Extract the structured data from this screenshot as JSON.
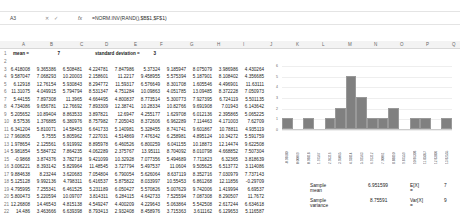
{
  "formula_bar": {
    "name_box": "A3",
    "icons": [
      "cancel-icon",
      "enter-icon"
    ],
    "fx_label": "fx",
    "formula": "=NORM.INV(RAND(),$B$1,$F$1)"
  },
  "columns": [
    "A",
    "B",
    "C",
    "D",
    "E",
    "F",
    "G",
    "H",
    "I",
    "J",
    "K",
    "L",
    "M",
    "N",
    "O",
    "P",
    "Q",
    "R"
  ],
  "header_row": {
    "row_num": "1",
    "mean_label": "mean =",
    "mean_value": "7",
    "sd_label": "standard deviation =",
    "sd_value": "3"
  },
  "rows": [
    {
      "n": "2",
      "cells": []
    },
    {
      "n": "3",
      "cells": [
        "6.418008",
        "9.365386",
        "6.508481",
        "4.224781",
        "7.847986",
        "5.37324",
        "9.185947",
        "8.075079",
        "3.986986",
        "4.430264"
      ]
    },
    {
      "n": "4",
      "cells": [
        "9.587047",
        "7.068293",
        "10.20003",
        "2.158601",
        "11.2217",
        "9.458955",
        "5.575394",
        "5.187901",
        "8.108402",
        "4.356685"
      ]
    },
    {
      "n": "5",
      "cells": [
        "6.12918",
        "12.76154",
        "5.930843",
        "8.294772",
        "11.59317",
        "6.576649",
        "8.301708",
        "1.605546",
        "4.496901",
        "11.63111"
      ]
    },
    {
      "n": "6",
      "cells": [
        "11.31075",
        "4.049915",
        "5.794794",
        "8.531347",
        "4.751284",
        "10.09863",
        "4.051785",
        "13.09485",
        "8.372228",
        "7.050973"
      ]
    },
    {
      "n": "7",
      "cells": [
        "5.44155",
        "7.897308",
        "11.3965",
        "4.664495",
        "4.800837",
        "8.773514",
        "5.300773",
        "7.927395",
        "6.724119",
        "5.501135"
      ]
    },
    {
      "n": "8",
      "cells": [
        "4.734086",
        "9.656781",
        "12.76692",
        "7.893309",
        "12.38741",
        "10.28334",
        "10.82766",
        "9.691908",
        "7.01943",
        "6.143642"
      ]
    },
    {
      "n": "9",
      "cells": [
        "5.205652",
        "10.89404",
        "8.863533",
        "3.897821",
        "12.6947",
        "4.255177",
        "1.629708",
        "6.012136",
        "2.395865",
        "5.065225"
      ]
    },
    {
      "n": "10",
      "cells": [
        "8.57536",
        "1.376885",
        "6.380976",
        "8.757982",
        "7.205043",
        "8.372606",
        "6.962289",
        "7.114463",
        "4.171003",
        "7.62709"
      ]
    },
    {
      "n": "11",
      "cells": [
        "6.341204",
        "5.810071",
        "14.58453",
        "6.641733",
        "5.140981",
        "5.328455",
        "8.741741",
        "9.601867",
        "10.78811",
        "4.935119"
      ]
    },
    {
      "n": "12",
      "cells": [
        "7.960805",
        "5.7555",
        "5.805962",
        "7.227031",
        "4.514869",
        "7.476342",
        "6.258981",
        "4.895124",
        "10.34272",
        "5.591759"
      ]
    },
    {
      "n": "13",
      "cells": [
        "1.978654",
        "2.125561",
        "6.919992",
        "8.895978",
        "6.460526",
        "6.800259",
        "6.041155",
        "10.18873",
        "12.14474",
        "9.622508"
      ]
    },
    {
      "n": "14",
      "cells": [
        "5.981854",
        "5.584732",
        "7.864235",
        "4.062289",
        "2.375767",
        "13.95111",
        "8.704092",
        "8.010798",
        "4.668852",
        "7.507304"
      ]
    },
    {
      "n": "15",
      "cells": [
        "-0.9868",
        "3.874376",
        "3.782718",
        "9.421099",
        "10.32928",
        "7.077356",
        "5.494689",
        "7.711823",
        "6.32365",
        "3.818639"
      ]
    },
    {
      "n": "16",
      "cells": [
        "3.006221",
        "8.393142",
        "5.829964",
        "11.48545",
        "3.727794",
        "5.497537",
        "11.0604",
        "9.505625",
        "6.513772",
        "3.114086"
      ]
    },
    {
      "n": "17",
      "cells": [
        "9.884638",
        "8.23244",
        "3.620683",
        "7.054804",
        "6.790054",
        "5.626064",
        "8.637119",
        "8.352716",
        "7.030979",
        "7.737143"
      ]
    },
    {
      "n": "18",
      "cells": [
        "5.125128",
        "9.992136",
        "4.798311",
        "6.416537",
        "5.875822",
        "8.033997",
        "10.55453",
        "6.861268",
        "12.11856",
        "-0.29709"
      ]
    },
    {
      "n": "19",
      "cells": [
        "4.795995",
        "7.255341",
        "6.461525",
        "5.231189",
        "6.050427",
        "5.570826",
        "5.007629",
        "9.742006",
        "1.419994",
        "6.69537"
      ]
    },
    {
      "n": "20",
      "cells": [
        "5.800473",
        "5.220594",
        "10.09707",
        "3.814311",
        "6.284115",
        "4.642733",
        "7.525594",
        "7.087308",
        "8.290507",
        "11.7672"
      ]
    },
    {
      "n": "21",
      "cells": [
        "12.26808",
        "14.46543",
        "4.815138",
        "4.549247",
        "4.400209",
        "4.229643",
        "5.063864",
        "5.542508",
        "2.617244",
        "6.634618"
      ]
    },
    {
      "n": "22",
      "cells": [
        "14.486",
        "3.463666",
        "6.639398",
        "8.793413",
        "2.932408",
        "8.458976",
        "3.715363",
        "3.611162",
        "6.129653",
        "5.116587"
      ]
    }
  ],
  "stats": {
    "sample_mean_label": "Sample mean",
    "sample_mean_value": "6.951599",
    "ex_label": "E[X] =",
    "ex_value": "7",
    "sample_variance_label": "Sample variance",
    "sample_variance_value": "8.75591",
    "varx_label": "Var[X] =",
    "varx_value": "9"
  },
  "chart_data": {
    "type": "bar",
    "title": "",
    "xlabel": "",
    "ylabel": "",
    "ylim": [
      0,
      6
    ],
    "yticks": [
      "0",
      "1",
      "2",
      "3",
      "4",
      "5",
      "6"
    ],
    "categories": [
      "-0.98680",
      "0.00069",
      "0.98818",
      "1.97567",
      "2.96316",
      "3.95065",
      "4.93814",
      "5.92563",
      "6.91312",
      "7.90061",
      "8.88810",
      "9.87559",
      "10.86308",
      "11.85057",
      "12.83806",
      "13.82555"
    ],
    "values": [
      1,
      0,
      1,
      0,
      1,
      2,
      5,
      3,
      1,
      1,
      2,
      0,
      1,
      1,
      0,
      1
    ],
    "grid": true,
    "legend": "none",
    "bar_color": "#808080"
  }
}
